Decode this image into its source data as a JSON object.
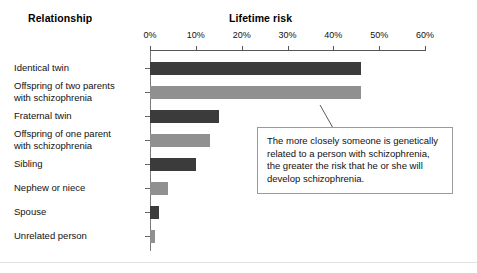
{
  "headers": {
    "category_header": "Relationship",
    "value_header": "Lifetime risk"
  },
  "chart_data": {
    "type": "bar",
    "orientation": "horizontal",
    "title": "Lifetime risk",
    "xlabel": "Lifetime risk",
    "ylabel": "Relationship",
    "xlim": [
      0,
      60
    ],
    "xtick_labels": [
      "0%",
      "10%",
      "20%",
      "30%",
      "40%",
      "50%",
      "60%"
    ],
    "xticks": [
      0,
      10,
      20,
      30,
      40,
      50,
      60
    ],
    "grid": false,
    "legend": "none",
    "units": "percent",
    "categories": [
      "Identical twin",
      "Offspring of two parents with schizophrenia",
      "Fraternal twin",
      "Offspring of one parent with schizophrenia",
      "Sibling",
      "Nephew or niece",
      "Spouse",
      "Unrelated person"
    ],
    "values": [
      46,
      46,
      15,
      13,
      10,
      4,
      2,
      1
    ],
    "colors": [
      "#3b3b3b",
      "#909090",
      "#3b3b3b",
      "#909090",
      "#3b3b3b",
      "#909090",
      "#3b3b3b",
      "#909090"
    ]
  },
  "rows": [
    {
      "label_line1": "Identical twin",
      "label_line2": "",
      "value": 46,
      "shade": "dark"
    },
    {
      "label_line1": "Offspring of two parents",
      "label_line2": "with schizophrenia",
      "value": 46,
      "shade": "light"
    },
    {
      "label_line1": "Fraternal twin",
      "label_line2": "",
      "value": 15,
      "shade": "dark"
    },
    {
      "label_line1": "Offspring of one parent",
      "label_line2": "with schizophrenia",
      "value": 13,
      "shade": "light"
    },
    {
      "label_line1": "Sibling",
      "label_line2": "",
      "value": 10,
      "shade": "dark"
    },
    {
      "label_line1": "Nephew or niece",
      "label_line2": "",
      "value": 4,
      "shade": "light"
    },
    {
      "label_line1": "Spouse",
      "label_line2": "",
      "value": 2,
      "shade": "dark"
    },
    {
      "label_line1": "Unrelated person",
      "label_line2": "",
      "value": 1,
      "shade": "light"
    }
  ],
  "callout": {
    "text": "The more closely someone is genetically related to a person with schizophrenia, the greater the risk that he or she will develop schizophrenia."
  }
}
